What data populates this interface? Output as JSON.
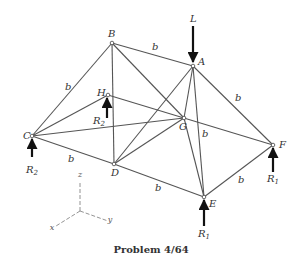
{
  "caption": "Problem 4/64",
  "colors": {
    "member": "#555555",
    "arrow": "#111111",
    "text": "#333333",
    "axis": "#777777"
  },
  "nodes": {
    "A": {
      "x": 193,
      "y": 66,
      "label": "A"
    },
    "B": {
      "x": 112,
      "y": 43,
      "label": "B"
    },
    "C": {
      "x": 32,
      "y": 136,
      "label": "C"
    },
    "D": {
      "x": 114,
      "y": 164,
      "label": "D"
    },
    "E": {
      "x": 204,
      "y": 197,
      "label": "E"
    },
    "F": {
      "x": 273,
      "y": 145,
      "label": "F"
    },
    "G": {
      "x": 184,
      "y": 118,
      "label": "G"
    },
    "H": {
      "x": 108,
      "y": 95,
      "label": "H"
    }
  },
  "members": [
    [
      "B",
      "A"
    ],
    [
      "B",
      "C"
    ],
    [
      "B",
      "D"
    ],
    [
      "B",
      "G"
    ],
    [
      "A",
      "F"
    ],
    [
      "A",
      "G"
    ],
    [
      "A",
      "E"
    ],
    [
      "A",
      "D"
    ],
    [
      "C",
      "H"
    ],
    [
      "C",
      "G"
    ],
    [
      "C",
      "D"
    ],
    [
      "D",
      "G"
    ],
    [
      "D",
      "E"
    ],
    [
      "E",
      "F"
    ],
    [
      "E",
      "G"
    ],
    [
      "H",
      "F"
    ]
  ],
  "length_labels": [
    {
      "text": "b",
      "x": 152,
      "y": 50
    },
    {
      "text": "b",
      "x": 65,
      "y": 90
    },
    {
      "text": "b",
      "x": 235,
      "y": 101
    },
    {
      "text": "b",
      "x": 202,
      "y": 137
    },
    {
      "text": "b",
      "x": 68,
      "y": 162
    },
    {
      "text": "b",
      "x": 155,
      "y": 191
    },
    {
      "text": "b",
      "x": 238,
      "y": 183
    }
  ],
  "loads": {
    "L": {
      "label": "L",
      "x": 193,
      "y1": 26,
      "y2": 62,
      "text_x": 190,
      "text_y": 22
    },
    "R2_C": {
      "label": "R",
      "sub": "2",
      "x": 32,
      "y1": 157,
      "y2": 139,
      "text_x": 26,
      "text_y": 173
    },
    "R2_H": {
      "label": "R",
      "sub": "2",
      "x": 107,
      "y1": 118,
      "y2": 98,
      "text_x": 93,
      "text_y": 124
    },
    "R1_E": {
      "label": "R",
      "sub": "1",
      "x": 204,
      "y1": 226,
      "y2": 200,
      "text_x": 198,
      "text_y": 237
    },
    "R1_F": {
      "label": "R",
      "sub": "1",
      "x": 273,
      "y1": 172,
      "y2": 148,
      "text_x": 267,
      "text_y": 182
    }
  },
  "axes": {
    "origin": {
      "x": 80,
      "y": 211
    },
    "z": {
      "label": "z",
      "x": 80,
      "y": 177
    },
    "y": {
      "label": "y",
      "x": 110,
      "y": 222
    },
    "x": {
      "label": "x",
      "x": 52,
      "y": 230
    }
  }
}
